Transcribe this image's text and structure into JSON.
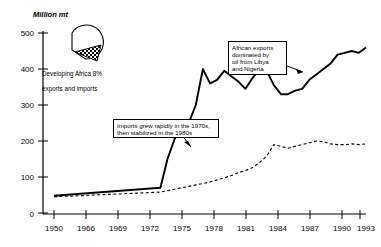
{
  "chart_data": {
    "type": "line",
    "title": "",
    "subtitle": "",
    "ylabel": "Million mt",
    "xlabel": "",
    "ylim": [
      0,
      500
    ],
    "yticks": [
      0,
      100,
      200,
      300,
      400,
      500
    ],
    "xticks": [
      "1950",
      "1966",
      "1969",
      "1972",
      "1975",
      "1978",
      "1981",
      "1984",
      "1987",
      "1990",
      "1993"
    ],
    "grid": false,
    "legend_position": "none",
    "x": [
      1950,
      1965,
      1966,
      1967,
      1968,
      1969,
      1970,
      1971,
      1972,
      1973,
      1974,
      1975,
      1976,
      1977,
      1978,
      1979,
      1980,
      1981,
      1982,
      1983,
      1984,
      1985,
      1986,
      1987,
      1988,
      1989,
      1990,
      1991,
      1992,
      1993,
      1994
    ],
    "series": [
      {
        "name": "Exports",
        "style": "solid",
        "color": "#000000",
        "values": [
          48,
          70,
          150,
          205,
          240,
          250,
          300,
          400,
          360,
          370,
          395,
          380,
          365,
          345,
          375,
          400,
          395,
          355,
          330,
          330,
          340,
          345,
          370,
          385,
          400,
          415,
          440,
          445,
          450,
          445,
          460
        ]
      },
      {
        "name": "Imports",
        "style": "dashed",
        "color": "#000000",
        "values": [
          45,
          58,
          62,
          66,
          70,
          74,
          78,
          82,
          86,
          92,
          98,
          104,
          112,
          118,
          126,
          140,
          158,
          190,
          185,
          180,
          185,
          190,
          195,
          200,
          198,
          192,
          190,
          190,
          192,
          190,
          192
        ]
      }
    ],
    "annotations": [
      {
        "name": "exports-callout",
        "text": "African exports dominated by oil from Libya and Nigeria",
        "lines": [
          "African exports",
          "dominated by",
          "oil from Libya",
          "and Nigeria"
        ]
      },
      {
        "name": "imports-callout",
        "text": "Imports grew rapidly in the 1970s, then stabilized in the 1980s",
        "lines": [
          "Imports grew rapidly in the 1970s,",
          "then stabilized in the 1980s"
        ]
      }
    ],
    "inset_pie": {
      "name": "developing-africa-pie",
      "label_lines": [
        "Developing Africa 8%",
        "exports and imports"
      ],
      "label": "Developing Africa 8% exports and imports",
      "slice_percent": 8,
      "slice_exploded": true,
      "slice_fill": "hatched"
    }
  },
  "axis": {
    "y_title": "Million mt",
    "y_labels": [
      "500",
      "400",
      "300",
      "200",
      "100",
      "0"
    ],
    "x_labels": [
      "1950",
      "1966",
      "1969",
      "1972",
      "1975",
      "1978",
      "1981",
      "1984",
      "1987",
      "1990",
      "1993"
    ]
  },
  "callouts": {
    "exports": {
      "l1": "African exports",
      "l2": "dominated by",
      "l3": "oil from Libya",
      "l4": "and Nigeria"
    },
    "imports": {
      "l1": "Imports grew rapidly in the 1970s,",
      "l2": "then stabilized in the 1980s"
    }
  },
  "pie": {
    "l1": "Developing Africa 8%",
    "l2": "exports and imports"
  },
  "colors": {
    "ink": "#000000",
    "background": "#ffffff"
  }
}
